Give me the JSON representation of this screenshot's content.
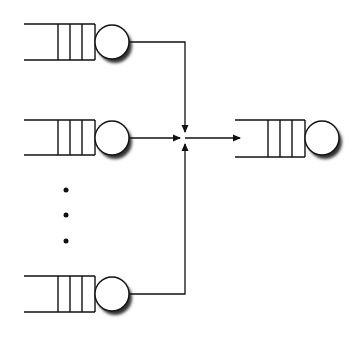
{
  "diagram": {
    "colors": {
      "stroke": "#111111",
      "shadow": "#444444",
      "background": "#ffffff"
    },
    "input_queues": [
      {
        "id": "q1",
        "y_center": 42
      },
      {
        "id": "q2",
        "y_center": 138
      },
      {
        "id": "qn",
        "y_center": 294
      }
    ],
    "ellipsis": {
      "symbol": "vertical-dots",
      "count": 3
    },
    "merge_point": {
      "x": 185,
      "y": 138
    },
    "output_queue": {
      "id": "q-out",
      "y_center": 138
    }
  }
}
